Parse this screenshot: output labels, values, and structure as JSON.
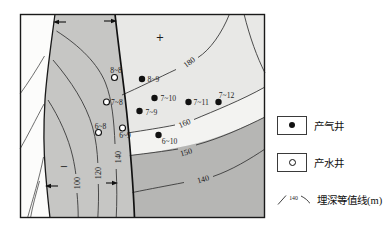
{
  "colors": {
    "fault_zone": "#c6c6c4",
    "west_zone": "#fcfcfb",
    "east_base": "#e8e8e6",
    "east_light_band": "#f3f3f1",
    "east_dark_band": "#b6b6b4"
  },
  "map": {
    "plus_symbol": "+",
    "minus_symbol": "−",
    "contour_labels": {
      "left_100": "100",
      "left_120": "120",
      "left_140": "140",
      "right_140": "140",
      "right_150": "150",
      "right_160": "160",
      "right_180": "180"
    },
    "wells": {
      "water": [
        {
          "label": "8~8"
        },
        {
          "label": "7~8"
        },
        {
          "label": "6~8"
        },
        {
          "label": "6~9"
        }
      ],
      "gas": [
        {
          "label": "8~9"
        },
        {
          "label": "7~10"
        },
        {
          "label": "7~11"
        },
        {
          "label": "7~12"
        },
        {
          "label": "7~9"
        },
        {
          "label": "6~10"
        }
      ]
    }
  },
  "legend": {
    "gas_label": "产气井",
    "water_label": "产水井",
    "contour_label": "埋深等值线(m)",
    "contour_symbol_value": "140"
  }
}
